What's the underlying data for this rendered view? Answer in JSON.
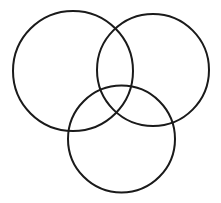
{
  "diagram": {
    "type": "venn",
    "background": "#ffffff",
    "stroke_color": "#1a1a1a",
    "stroke_width": 2,
    "circles": [
      {
        "id": "top-left",
        "cx": 73,
        "cy": 71,
        "r": 60
      },
      {
        "id": "top-right",
        "cx": 153,
        "cy": 70,
        "r": 56
      },
      {
        "id": "bottom",
        "cx": 121.5,
        "cy": 139,
        "r": 53.5
      }
    ]
  }
}
